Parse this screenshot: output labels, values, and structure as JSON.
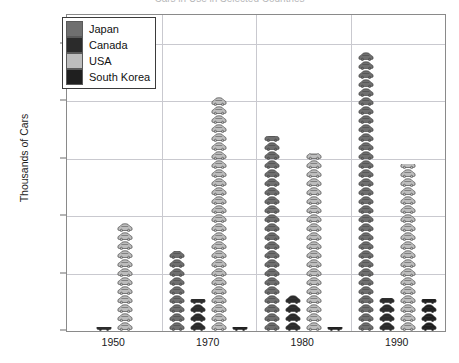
{
  "chart_data": {
    "type": "bar",
    "title": "Cars in Use in Selected Countries",
    "xlabel": "",
    "ylabel": "Thousands of Cars",
    "categories": [
      "1950",
      "1970",
      "1980",
      "1990"
    ],
    "ylim": [
      0,
      11000
    ],
    "yticks": [
      0,
      2000,
      4000,
      6000,
      8000,
      10000
    ],
    "ytick_labels": [
      "0",
      "2 000",
      "4 000",
      "6 000",
      "8 000",
      "10 000"
    ],
    "grid": true,
    "legend_position": "upper-left",
    "series": [
      {
        "name": "Japan",
        "color": "#6f6f6f",
        "values": [
          0,
          2800,
          6800,
          9800
        ]
      },
      {
        "name": "Canada",
        "color": "#2b2b2b",
        "values": [
          120,
          1100,
          1300,
          1150
        ]
      },
      {
        "name": "USA",
        "color": "#bdbdbd",
        "values": [
          3750,
          8300,
          6200,
          5800
        ]
      },
      {
        "name": "South Korea",
        "color": "#1f1f1f",
        "values": [
          0,
          120,
          150,
          1100
        ]
      }
    ]
  },
  "legend": {
    "items": [
      {
        "label": "Japan",
        "color": "#6f6f6f"
      },
      {
        "label": "Canada",
        "color": "#2b2b2b"
      },
      {
        "label": "USA",
        "color": "#bdbdbd"
      },
      {
        "label": "South Korea",
        "color": "#1f1f1f"
      }
    ]
  }
}
